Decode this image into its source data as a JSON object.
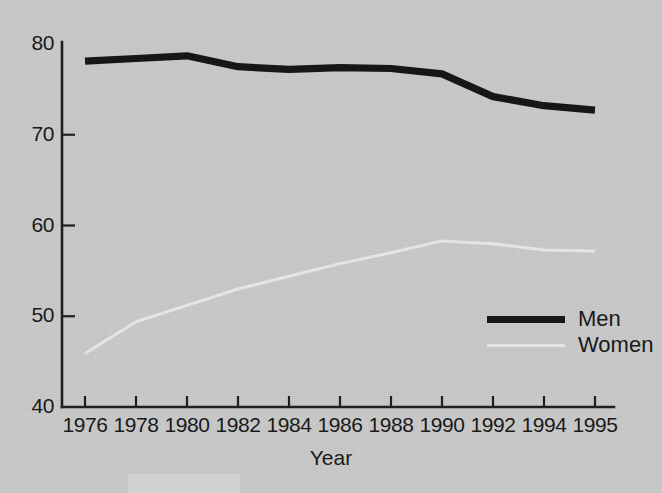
{
  "chart_data": {
    "type": "line",
    "title": "",
    "xlabel": "Year",
    "ylabel": "",
    "x": [
      1976,
      1978,
      1980,
      1982,
      1984,
      1986,
      1988,
      1990,
      1992,
      1994,
      1995
    ],
    "xtick_labels": [
      "1976",
      "1978",
      "1980",
      "1982",
      "1984",
      "1986",
      "1988",
      "1990",
      "1992",
      "1994",
      "1995"
    ],
    "ytick_labels": [
      "40",
      "50",
      "60",
      "70",
      "80"
    ],
    "yticks": [
      40,
      50,
      60,
      70,
      80
    ],
    "ylim": [
      40,
      80
    ],
    "xlim": [
      1976,
      1995
    ],
    "grid": false,
    "legend_position": "center-right",
    "series": [
      {
        "name": "Men",
        "color": "#141414",
        "values": [
          78.1,
          78.4,
          78.7,
          77.5,
          77.2,
          77.4,
          77.3,
          76.7,
          74.2,
          73.2,
          72.7
        ]
      },
      {
        "name": "Women",
        "color": "#e8e8e8",
        "values": [
          45.9,
          49.4,
          51.2,
          53.0,
          54.4,
          55.8,
          57.0,
          58.3,
          58.0,
          57.3,
          57.2
        ]
      }
    ]
  },
  "legend": {
    "items": [
      {
        "label": "Men",
        "style": "thick-black-line"
      },
      {
        "label": "Women",
        "style": "thin-light-line"
      }
    ]
  },
  "axes": {
    "x_axis_title": "Year",
    "y_axis_title": ""
  },
  "colors": {
    "background": "#c9c9c9",
    "axis": "#1c1c1c",
    "men_series": "#141414",
    "women_series": "#e8e8e8",
    "text": "#171717"
  }
}
